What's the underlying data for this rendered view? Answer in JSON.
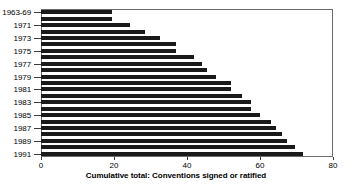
{
  "chart_data": {
    "type": "bar",
    "orientation": "horizontal",
    "title": "",
    "xlabel": "Cumulative total: Conventions signed or ratified",
    "ylabel": "",
    "xlim": [
      0,
      80
    ],
    "xticks": [
      0,
      20,
      40,
      60,
      80
    ],
    "xtick_labels": [
      "0",
      "20",
      "40",
      "60",
      "80"
    ],
    "grid": false,
    "legend": null,
    "bar_color": "#1a1a1a",
    "frame_color": "#6b6b6b",
    "categories": [
      "1963-69",
      "1970",
      "1971",
      "1972",
      "1973",
      "1974",
      "1975",
      "1976",
      "1977",
      "1978",
      "1979",
      "1980",
      "1981",
      "1982",
      "1983",
      "1984",
      "1985",
      "1986",
      "1987",
      "1988",
      "1989",
      "1990",
      "1991"
    ],
    "ytick_labels": [
      "1963-69",
      "1971",
      "1973",
      "1975",
      "1977",
      "1979",
      "1981",
      "1983",
      "1985",
      "1987",
      "1989",
      "1991"
    ],
    "ytick_categories": [
      "1963-69",
      "1971",
      "1973",
      "1975",
      "1977",
      "1979",
      "1981",
      "1983",
      "1985",
      "1987",
      "1989",
      "1991"
    ],
    "values": [
      19.5,
      19.5,
      24.5,
      28.5,
      32.5,
      37,
      37,
      42,
      44,
      45.5,
      48,
      52,
      52,
      55,
      57.5,
      57.5,
      60,
      63,
      64.5,
      66,
      67.5,
      69.5,
      71.8
    ]
  }
}
